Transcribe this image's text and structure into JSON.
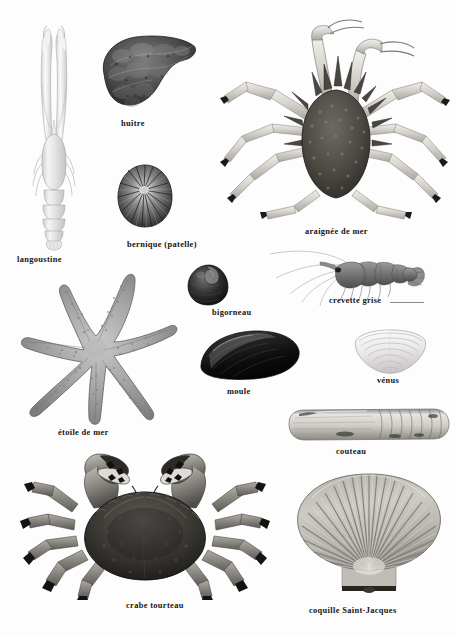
{
  "plate": {
    "title": "Fruits de mer",
    "language": "fr",
    "background_color": "#fdfdfd",
    "text_color": "#151515"
  },
  "specimens": [
    {
      "id": "langoustine",
      "label": "langoustine",
      "kind": "crustacean",
      "view": "dorsal",
      "tone": "pale-grey",
      "label_x": 17,
      "label_y": 255,
      "fig_x": 26,
      "fig_y": 22,
      "fig_w": 56,
      "fig_h": 228
    },
    {
      "id": "huitre",
      "label": "huître",
      "kind": "bivalve",
      "view": "outer-shell",
      "tone": "dark-mottled",
      "label_x": 121,
      "label_y": 119,
      "fig_x": 96,
      "fig_y": 30,
      "fig_w": 102,
      "fig_h": 82
    },
    {
      "id": "araignee-de-mer",
      "label": "araignée de mer",
      "kind": "crustacean",
      "view": "dorsal",
      "tone": "spiny-dark",
      "label_x": 305,
      "label_y": 227,
      "fig_x": 216,
      "fig_y": 12,
      "fig_w": 236,
      "fig_h": 212
    },
    {
      "id": "bernique-patelle",
      "label": "bernique (patelle)",
      "kind": "gastropod",
      "view": "top",
      "tone": "ribbed-dark",
      "label_x": 127,
      "label_y": 240,
      "fig_x": 116,
      "fig_y": 163,
      "fig_w": 58,
      "fig_h": 66
    },
    {
      "id": "bigorneau",
      "label": "bigorneau",
      "kind": "gastropod",
      "view": "side",
      "tone": "very-dark",
      "label_x": 212,
      "label_y": 308,
      "fig_x": 185,
      "fig_y": 263,
      "fig_w": 48,
      "fig_h": 44
    },
    {
      "id": "crevette-grise",
      "label": "crevette grise",
      "kind": "crustacean",
      "view": "lateral",
      "tone": "mid-grey",
      "label_x": 329,
      "label_y": 296,
      "fig_x": 250,
      "fig_y": 248,
      "fig_w": 176,
      "fig_h": 62
    },
    {
      "id": "etoile-de-mer",
      "label": "étoile de mer",
      "kind": "echinoderm",
      "view": "dorsal",
      "tone": "granular-grey",
      "label_x": 58,
      "label_y": 428,
      "fig_x": 18,
      "fig_y": 268,
      "fig_w": 156,
      "fig_h": 158
    },
    {
      "id": "moule",
      "label": "moule",
      "kind": "bivalve",
      "view": "side",
      "tone": "black-gloss",
      "label_x": 227,
      "label_y": 387,
      "fig_x": 197,
      "fig_y": 329,
      "fig_w": 104,
      "fig_h": 52
    },
    {
      "id": "venus",
      "label": "vénus",
      "kind": "bivalve",
      "view": "outer-shell",
      "tone": "pale-ringed",
      "label_x": 377,
      "label_y": 376,
      "fig_x": 350,
      "fig_y": 330,
      "fig_w": 80,
      "fig_h": 44
    },
    {
      "id": "couteau",
      "label": "couteau",
      "kind": "bivalve",
      "view": "lateral",
      "tone": "banded-grey",
      "label_x": 336,
      "label_y": 447,
      "fig_x": 283,
      "fig_y": 406,
      "fig_w": 168,
      "fig_h": 38
    },
    {
      "id": "crabe-tourteau",
      "label": "crabe tourteau",
      "kind": "crustacean",
      "view": "dorsal",
      "tone": "dark-carapace",
      "label_x": 126,
      "label_y": 601,
      "fig_x": 20,
      "fig_y": 448,
      "fig_w": 250,
      "fig_h": 152
    },
    {
      "id": "coquille-saint-jacques",
      "label": "coquille Saint-Jacques",
      "kind": "bivalve",
      "view": "outer-shell",
      "tone": "ribbed-pale",
      "label_x": 309,
      "label_y": 606,
      "fig_x": 288,
      "fig_y": 470,
      "fig_w": 162,
      "fig_h": 128
    }
  ]
}
